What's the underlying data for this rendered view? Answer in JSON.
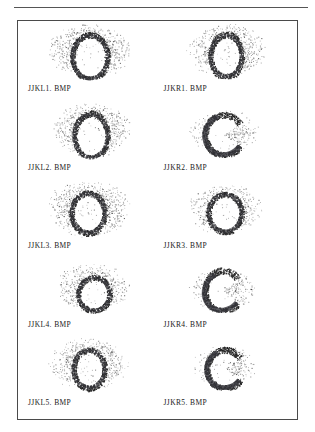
{
  "figure": {
    "border_color": "#4a4a4a",
    "rule_color": "#555555",
    "background": "#ffffff",
    "ink_color": "#2b2b2b",
    "columns": 2,
    "rows": 5
  },
  "panels": [
    {
      "id": "panel-1",
      "caption": "JJKL1. BMP",
      "shape": "closed-ring",
      "ring_cx": 46,
      "ring_cy": 33,
      "ring_rx": 15,
      "ring_ry": 19,
      "ring_thickness": 5,
      "cloud_cx": 46,
      "cloud_cy": 26,
      "cloud_rx": 40,
      "cloud_ry": 27,
      "density": 0.85,
      "open_gap": 0
    },
    {
      "id": "panel-2",
      "caption": "JJKL2. BMP",
      "shape": "closed-ring",
      "ring_cx": 47,
      "ring_cy": 33,
      "ring_rx": 14,
      "ring_ry": 19,
      "ring_thickness": 5,
      "cloud_cx": 47,
      "cloud_cy": 26,
      "cloud_rx": 38,
      "cloud_ry": 26,
      "density": 0.8,
      "open_gap": 0
    },
    {
      "id": "panel-3",
      "caption": "JJKL3. BMP",
      "shape": "closed-ring",
      "ring_cx": 44,
      "ring_cy": 32,
      "ring_rx": 14,
      "ring_ry": 17,
      "ring_thickness": 5,
      "cloud_cx": 44,
      "cloud_cy": 27,
      "cloud_rx": 40,
      "cloud_ry": 27,
      "density": 0.88,
      "open_gap": 0
    },
    {
      "id": "panel-4",
      "caption": "JJKL4. BMP",
      "shape": "closed-ring",
      "ring_cx": 50,
      "ring_cy": 34,
      "ring_rx": 13,
      "ring_ry": 14,
      "ring_thickness": 5,
      "cloud_cx": 48,
      "cloud_cy": 28,
      "cloud_rx": 36,
      "cloud_ry": 24,
      "density": 0.72,
      "open_gap": 0
    },
    {
      "id": "panel-5",
      "caption": "JJKL5. BMP",
      "shape": "closed-ring",
      "ring_cx": 45,
      "ring_cy": 31,
      "ring_rx": 13,
      "ring_ry": 16,
      "ring_thickness": 5,
      "cloud_cx": 45,
      "cloud_cy": 26,
      "cloud_rx": 38,
      "cloud_ry": 25,
      "density": 0.8,
      "open_gap": 0
    },
    {
      "id": "panel-6",
      "caption": "JJKR1. BMP",
      "shape": "closed-ring",
      "ring_cx": 47,
      "ring_cy": 32,
      "ring_rx": 13,
      "ring_ry": 18,
      "ring_thickness": 5,
      "cloud_cx": 47,
      "cloud_cy": 26,
      "cloud_rx": 38,
      "cloud_ry": 26,
      "density": 0.82,
      "open_gap": 0
    },
    {
      "id": "panel-7",
      "caption": "JJKR2. BMP",
      "shape": "open-ring",
      "ring_cx": 45,
      "ring_cy": 32,
      "ring_rx": 16,
      "ring_ry": 17,
      "ring_thickness": 6,
      "cloud_cx": 45,
      "cloud_cy": 30,
      "cloud_rx": 34,
      "cloud_ry": 22,
      "density": 0.6,
      "open_gap": 70
    },
    {
      "id": "panel-8",
      "caption": "JJKR3. BMP",
      "shape": "closed-ring",
      "ring_cx": 46,
      "ring_cy": 32,
      "ring_rx": 14,
      "ring_ry": 16,
      "ring_thickness": 5,
      "cloud_cx": 46,
      "cloud_cy": 28,
      "cloud_rx": 36,
      "cloud_ry": 24,
      "density": 0.78,
      "open_gap": 0
    },
    {
      "id": "panel-9",
      "caption": "JJKR4. BMP",
      "shape": "open-ring",
      "ring_cx": 44,
      "ring_cy": 31,
      "ring_rx": 15,
      "ring_ry": 17,
      "ring_thickness": 6,
      "cloud_cx": 44,
      "cloud_cy": 29,
      "cloud_rx": 32,
      "cloud_ry": 21,
      "density": 0.6,
      "open_gap": 80
    },
    {
      "id": "panel-10",
      "caption": "JJKR5. BMP",
      "shape": "open-ring",
      "ring_cx": 46,
      "ring_cy": 31,
      "ring_rx": 15,
      "ring_ry": 16,
      "ring_thickness": 6,
      "cloud_cx": 46,
      "cloud_cy": 29,
      "cloud_rx": 32,
      "cloud_ry": 21,
      "density": 0.58,
      "open_gap": 75
    }
  ]
}
